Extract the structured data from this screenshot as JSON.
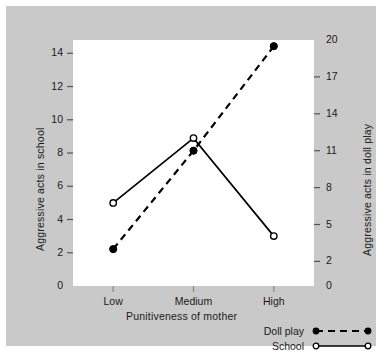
{
  "chart_data": {
    "type": "line",
    "title": "",
    "xlabel": "Punitiveness of mother",
    "categories": [
      "Low",
      "Medium",
      "High"
    ],
    "axes": {
      "left": {
        "label": "Aggressive acts in school",
        "ticks": [
          0,
          2,
          4,
          6,
          8,
          10,
          12,
          14
        ],
        "ylim": [
          0,
          14.8
        ]
      },
      "right": {
        "label": "Aggressive acts in doll play",
        "ticks": [
          0,
          2,
          5,
          8,
          11,
          14,
          17,
          20
        ],
        "ylim": [
          0,
          20
        ]
      }
    },
    "grid": false,
    "legend_position": "bottom-right",
    "series": [
      {
        "name": "Doll play",
        "axis": "right",
        "values": [
          3.0,
          11.0,
          19.5
        ],
        "line_style": "dashed",
        "marker": "filled-circle",
        "color": "#000000"
      },
      {
        "name": "School",
        "axis": "left",
        "values": [
          5.0,
          8.9,
          3.0
        ],
        "line_style": "solid",
        "marker": "open-circle",
        "color": "#000000"
      }
    ]
  },
  "legend": {
    "items": [
      {
        "label": "Doll play",
        "style": "dashed-filled"
      },
      {
        "label": "School",
        "style": "solid-open"
      }
    ]
  },
  "colors": {
    "figure_background": "#c9c9c9",
    "plot_background": "#ffffff",
    "ink": "#000000",
    "page_background": "#ffffff"
  }
}
